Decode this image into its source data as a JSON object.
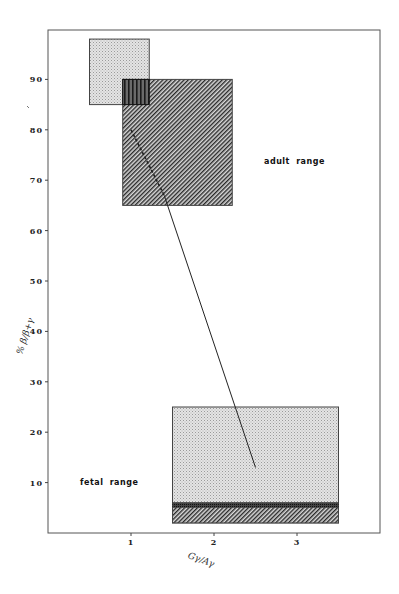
{
  "chart_data": {
    "type": "scatter",
    "title": "",
    "xlabel": "Gγ/Aγ",
    "ylabel": "% β/β+γ",
    "xlim": [
      0,
      4
    ],
    "ylim": [
      0,
      100
    ],
    "grid": false,
    "legend": null,
    "x_ticks": [
      1,
      2,
      3
    ],
    "y_ticks": [
      10,
      20,
      30,
      40,
      50,
      60,
      70,
      80,
      90
    ],
    "regions": [
      {
        "name": "upper-stippled-box",
        "fill": "stipple",
        "x": [
          0.5,
          1.22
        ],
        "y": [
          85,
          98
        ]
      },
      {
        "name": "adult-hatched-box",
        "fill": "hatch",
        "x": [
          0.9,
          2.22
        ],
        "y": [
          65,
          90
        ]
      },
      {
        "name": "fetal-stippled-box",
        "fill": "stipple",
        "x": [
          1.5,
          3.5
        ],
        "y": [
          2,
          25
        ]
      },
      {
        "name": "fetal-hatched-band",
        "fill": "hatch",
        "x": [
          1.5,
          3.5
        ],
        "y": [
          2,
          6
        ]
      },
      {
        "name": "fetal-dark-line",
        "fill": "dark",
        "x": [
          1.5,
          3.5
        ],
        "y": [
          5,
          6
        ]
      }
    ],
    "series": [
      {
        "name": "trajectory",
        "style": "line",
        "points": [
          {
            "x": 1.0,
            "y": 80
          },
          {
            "x": 1.4,
            "y": 67
          },
          {
            "x": 2.5,
            "y": 13
          }
        ],
        "dashed_segment": [
          0,
          1
        ]
      }
    ],
    "annotations": [
      {
        "text": "adult range",
        "x": 2.6,
        "y": 73.5
      },
      {
        "text": "fetal range",
        "x": 0.38,
        "y": 10
      }
    ]
  },
  "labels": {
    "xlabel": "Gγ/Aγ",
    "ylabel": "% β/β+γ",
    "adult": "adult range",
    "fetal": "fetal range"
  }
}
